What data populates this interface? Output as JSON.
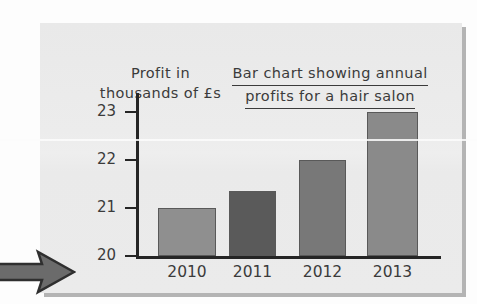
{
  "page": {
    "ghost_show_through": [
      "Questions",
      "following to this",
      "answer the",
      "bar chart"
    ],
    "marker_icon": "right-arrow-icon"
  },
  "chart_data": {
    "type": "bar",
    "title": "Bar chart showing annual profits for a hair salon",
    "title_line1": "Bar chart showing annual",
    "title_line2": "profits for a hair salon",
    "ylabel": "Profit in thousands of £s",
    "ylabel_line1": "Profit in",
    "ylabel_line2": "thousands of £s",
    "xlabel": "",
    "categories": [
      "2010",
      "2011",
      "2012",
      "2013"
    ],
    "values": [
      21,
      21.35,
      22,
      23
    ],
    "ylim": [
      20,
      23.4
    ],
    "yticks": [
      "20",
      "21",
      "22",
      "23"
    ],
    "ytick_values": [
      20,
      21,
      22,
      23
    ],
    "grid": false,
    "legend": false,
    "bar_colors": [
      "#8f8f8f",
      "#5a5a5a",
      "#787878",
      "#8a8a8a"
    ],
    "panel_color": "#ebebeb",
    "axis_color": "#252525",
    "text_color": "#3b3b3b"
  }
}
